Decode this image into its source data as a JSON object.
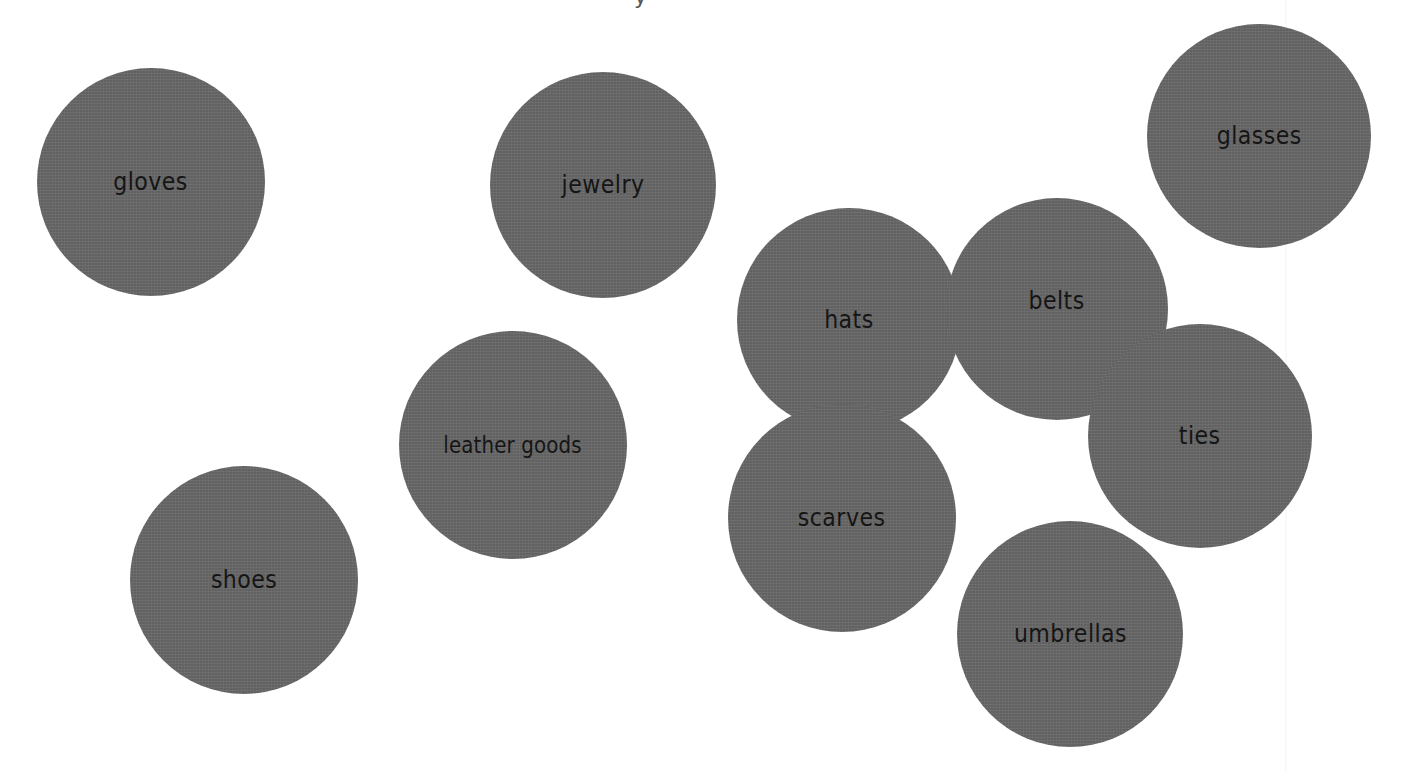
{
  "page": {
    "background": "#ffffff",
    "bubble_color": "#676767",
    "label_color": "#151515",
    "title_fragment": "y"
  },
  "bubbles": [
    {
      "label": "gloves",
      "cx": 151,
      "cy": 182,
      "r": 114
    },
    {
      "label": "jewelry",
      "cx": 603,
      "cy": 185,
      "r": 113
    },
    {
      "label": "glasses",
      "cx": 1259,
      "cy": 136,
      "r": 112
    },
    {
      "label": "hats",
      "cx": 849,
      "cy": 320,
      "r": 112
    },
    {
      "label": "belts",
      "cx": 1057,
      "cy": 309,
      "r": 111
    },
    {
      "label": "leather goods",
      "cx": 513,
      "cy": 445,
      "r": 114
    },
    {
      "label": "ties",
      "cx": 1200,
      "cy": 436,
      "r": 112
    },
    {
      "label": "scarves",
      "cx": 842,
      "cy": 518,
      "r": 114
    },
    {
      "label": "shoes",
      "cx": 244,
      "cy": 580,
      "r": 114
    },
    {
      "label": "umbrellas",
      "cx": 1070,
      "cy": 634,
      "r": 113
    }
  ]
}
